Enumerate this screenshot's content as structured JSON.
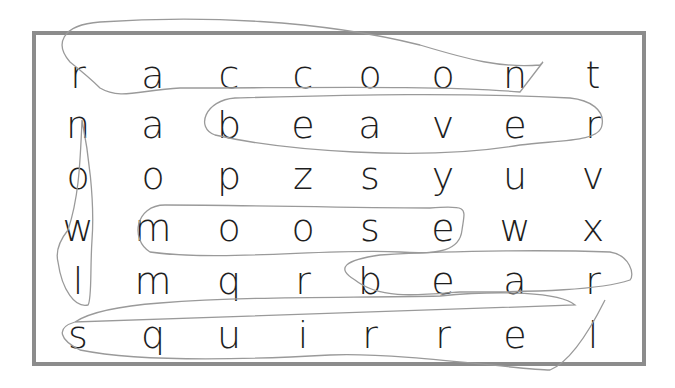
{
  "puzzle": {
    "type": "word-search",
    "rows": [
      [
        "r",
        "a",
        "c",
        "c",
        "o",
        "o",
        "n",
        "t"
      ],
      [
        "n",
        "a",
        "b",
        "e",
        "a",
        "v",
        "e",
        "r"
      ],
      [
        "o",
        "o",
        "p",
        "z",
        "s",
        "y",
        "u",
        "v"
      ],
      [
        "w",
        "m",
        "o",
        "o",
        "s",
        "e",
        "w",
        "x"
      ],
      [
        "l",
        "m",
        "q",
        "r",
        "b",
        "e",
        "a",
        "r"
      ],
      [
        "s",
        "q",
        "u",
        "i",
        "r",
        "r",
        "e",
        "l"
      ]
    ],
    "found_words": [
      "raccoon",
      "beaver",
      "moose",
      "bear",
      "squirrel",
      "owl"
    ],
    "colors": {
      "border": "#8c8c8c",
      "letters": "#1e1e1e",
      "pencil": "#9a9a9a"
    }
  }
}
